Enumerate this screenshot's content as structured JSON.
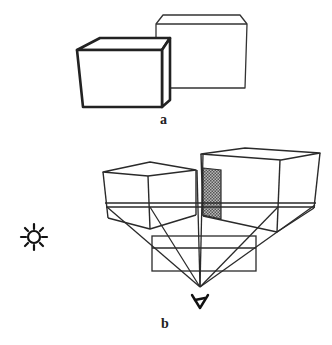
{
  "figure": {
    "panel_a": {
      "label": "a",
      "description": "Two boxes; left box drawn with thick outline, right box thin outline"
    },
    "panel_b": {
      "label": "b",
      "description": "Two boxes viewed in perspective with projection lines converging to an eye point; shaded face; light source symbol"
    }
  },
  "symbols": {
    "light_source": "sun-icon",
    "viewer": "eye-icon"
  },
  "colors": {
    "stroke": "#2a2a2a",
    "shade": "#8a8a8a",
    "background": "#ffffff"
  }
}
